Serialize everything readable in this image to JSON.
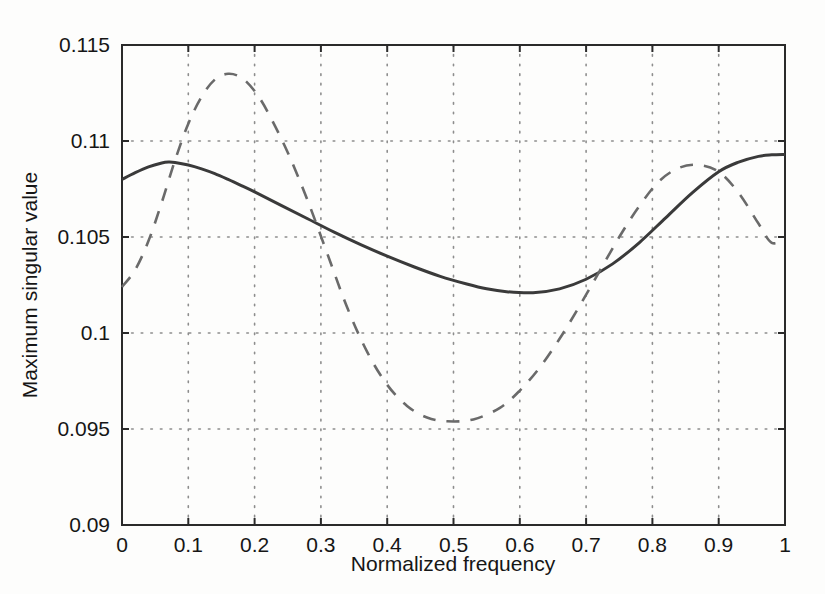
{
  "chart_data": {
    "type": "line",
    "title": "",
    "xlabel": "Normalized frequency",
    "ylabel": "Maximum singular value",
    "xlim": [
      0,
      1
    ],
    "ylim": [
      0.09,
      0.115
    ],
    "xticks": [
      "0",
      "0.1",
      "0.2",
      "0.3",
      "0.4",
      "0.5",
      "0.6",
      "0.7",
      "0.8",
      "0.9",
      "1"
    ],
    "xtick_values": [
      0,
      0.1,
      0.2,
      0.3,
      0.4,
      0.5,
      0.6,
      0.7,
      0.8,
      0.9,
      1
    ],
    "yticks": [
      "0.09",
      "0.095",
      "0.1",
      "0.105",
      "0.11",
      "0.115"
    ],
    "ytick_values": [
      0.09,
      0.095,
      0.1,
      0.105,
      0.11,
      0.115
    ],
    "grid": true,
    "grid_style": "dotted",
    "legend": null,
    "series": [
      {
        "name": "solid-curve",
        "style": "solid",
        "color": "#3a3a3a",
        "x": [
          0.0,
          0.02,
          0.04,
          0.06,
          0.07,
          0.08,
          0.1,
          0.12,
          0.14,
          0.16,
          0.18,
          0.2,
          0.24,
          0.28,
          0.32,
          0.36,
          0.4,
          0.44,
          0.48,
          0.52,
          0.55,
          0.58,
          0.62,
          0.66,
          0.7,
          0.74,
          0.78,
          0.82,
          0.86,
          0.9,
          0.93,
          0.96,
          0.98,
          1.0
        ],
        "y": [
          0.108,
          0.10835,
          0.10865,
          0.10885,
          0.1089,
          0.10888,
          0.10875,
          0.10855,
          0.1083,
          0.108,
          0.10768,
          0.10735,
          0.10665,
          0.10595,
          0.10525,
          0.1046,
          0.104,
          0.10345,
          0.10295,
          0.10255,
          0.1023,
          0.10215,
          0.1021,
          0.1023,
          0.1028,
          0.1036,
          0.1047,
          0.106,
          0.1073,
          0.1084,
          0.1089,
          0.1092,
          0.10928,
          0.1093
        ]
      },
      {
        "name": "dashed-curve",
        "style": "dashed",
        "color": "#6a6a6a",
        "x": [
          0.0,
          0.02,
          0.04,
          0.06,
          0.08,
          0.1,
          0.12,
          0.14,
          0.16,
          0.18,
          0.2,
          0.22,
          0.25,
          0.28,
          0.31,
          0.34,
          0.37,
          0.4,
          0.43,
          0.46,
          0.49,
          0.53,
          0.57,
          0.6,
          0.63,
          0.66,
          0.69,
          0.72,
          0.75,
          0.78,
          0.81,
          0.84,
          0.87,
          0.9,
          0.93,
          0.96,
          0.98,
          1.0
        ],
        "y": [
          0.1024,
          0.1033,
          0.1048,
          0.1068,
          0.109,
          0.1109,
          0.1123,
          0.1132,
          0.1135,
          0.1133,
          0.1126,
          0.1115,
          0.1094,
          0.1069,
          0.1041,
          0.1013,
          0.099,
          0.0973,
          0.0962,
          0.0956,
          0.0954,
          0.0955,
          0.0961,
          0.097,
          0.0982,
          0.0997,
          0.1014,
          0.1032,
          0.105,
          0.1066,
          0.1079,
          0.1086,
          0.10875,
          0.1084,
          0.1073,
          0.1057,
          0.1047,
          0.1049
        ]
      }
    ]
  },
  "axes": {
    "plot_left_px": 122,
    "plot_right_px": 785,
    "plot_top_px": 45,
    "plot_bottom_px": 525
  }
}
